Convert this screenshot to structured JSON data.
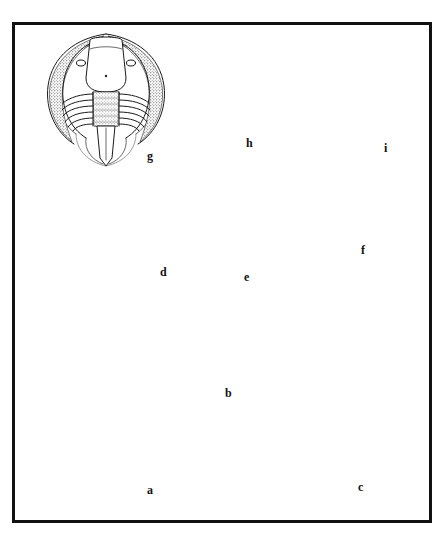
{
  "plate": {
    "kind": "scientific-illustration-plate",
    "subject": "Fossil invertebrates: trilobites, brachiopods and a graptolite",
    "background_color": "#ffffff",
    "ink_color": "#1a1a1a",
    "border_color": "#111111",
    "border": {
      "x": 12,
      "y": 22,
      "width": 420,
      "height": 501,
      "thickness": 3
    }
  },
  "figures": [
    {
      "id": "a",
      "label": "a",
      "label_x": 148,
      "label_y": 490,
      "common_name": "trilobite",
      "description": "Large trilobite, dorsal view; wide cephalon with crescentic genal areas, long tapering glabella, many thoracic segments with falcate pleurae, small pygidium",
      "bbox": {
        "x": 52,
        "y": 300,
        "width": 135,
        "height": 195
      }
    },
    {
      "id": "b",
      "label": "b",
      "label_x": 226,
      "label_y": 393,
      "common_name": "brachiopod / bivalve shell",
      "description": "Small oval shell with concentric growth lines, dorsal view, shown above a wedge-shaped lateral profile view",
      "bbox": {
        "x": 206,
        "y": 327,
        "width": 50,
        "height": 62
      },
      "profile_bbox": {
        "x": 205,
        "y": 405,
        "width": 62,
        "height": 33
      }
    },
    {
      "id": "c",
      "label": "c",
      "label_x": 359,
      "label_y": 487,
      "common_name": "spiny trilobite",
      "description": "Spinose trilobite with long curved genal spines, narrow axial lobe, spine-tipped pleurae and a fringe of caudal spines",
      "bbox": {
        "x": 274,
        "y": 268,
        "width": 135,
        "height": 222
      }
    },
    {
      "id": "d",
      "label": "d",
      "label_x": 162,
      "label_y": 272,
      "common_name": "brachiopod",
      "description": "Fan-shaped brachiopod valve with strong radiating costae (ribs) and a pointed beak",
      "bbox": {
        "x": 53,
        "y": 187,
        "width": 123,
        "height": 98
      }
    },
    {
      "id": "e",
      "label": "e",
      "label_x": 245,
      "label_y": 277,
      "common_name": "trilobite",
      "description": "Trilobite with prominent crescentic eye lobes, rectangular glabella and about twelve thoracic segments",
      "bbox": {
        "x": 186,
        "y": 182,
        "width": 82,
        "height": 110
      }
    },
    {
      "id": "f",
      "label": "f",
      "label_x": 362,
      "label_y": 250,
      "common_name": "clam / bivalve shell",
      "description": "Ovate shell with fine concentric growth lines and a small apical beak",
      "bbox": {
        "x": 304,
        "y": 172,
        "width": 72,
        "height": 90
      }
    },
    {
      "id": "g",
      "label": "g",
      "label_x": 148,
      "label_y": 156,
      "common_name": "trilobite",
      "description": "Broad trilobite with wing-like free cheeks, large smooth glabella, ribbed thorax and long narrow pygidial tail",
      "bbox": {
        "x": 47,
        "y": 30,
        "width": 118,
        "height": 135
      }
    },
    {
      "id": "h",
      "label": "h",
      "label_x": 247,
      "label_y": 143,
      "common_name": "trilobite",
      "description": "Small elongate trilobite with rounded cephalon, narrow thorax and short genal spines",
      "bbox": {
        "x": 196,
        "y": 52,
        "width": 58,
        "height": 95
      }
    },
    {
      "id": "i",
      "label": "i",
      "label_x": 385,
      "label_y": 148,
      "common_name": "graptolite / reticulate conical fossil",
      "description": "Conical pointed fossil with a reticulate mesh of longitudinal and transverse threads",
      "bbox": {
        "x": 305,
        "y": 32,
        "width": 82,
        "height": 118
      }
    }
  ]
}
